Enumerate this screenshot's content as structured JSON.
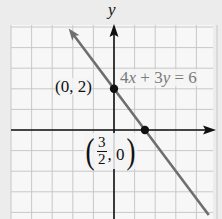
{
  "chart_data": {
    "type": "line",
    "title": "",
    "equation": "4x + 3y = 6",
    "xlabel": "",
    "ylabel": "y",
    "grid": true,
    "grid_unit": 1,
    "xlim": [
      -5,
      5
    ],
    "ylim": [
      -4,
      5
    ],
    "series": [
      {
        "name": "4x + 3y = 6",
        "slope": -1.3333,
        "intercept": 2,
        "x": [
          -2.2,
          4.6
        ],
        "y": [
          4.93,
          -4.13
        ],
        "color": "#6e6e6e"
      }
    ],
    "points": [
      {
        "x": 0,
        "y": 2,
        "label": "(0, 2)"
      },
      {
        "x": 1.5,
        "y": 0,
        "label": "(3/2, 0)"
      }
    ],
    "annotations": [
      {
        "text": "4x + 3y = 6",
        "near": [
          0,
          2
        ]
      },
      {
        "text": "(0, 2)",
        "near": [
          0,
          2
        ]
      },
      {
        "text": "(3/2, 0)",
        "near": [
          1.5,
          0
        ]
      }
    ]
  },
  "labels": {
    "y_axis": "y",
    "equation": {
      "c1": "4",
      "v1": "x",
      "op": " + ",
      "c2": "3",
      "v2": "y",
      "rhs": " = 6"
    },
    "point1": "(0, 2)",
    "point2": {
      "open": "(",
      "num": "3",
      "den": "2",
      "rest": ", 0",
      "close": ")"
    }
  },
  "colors": {
    "background": "#ececec",
    "plot_area": "#f7f7f7",
    "grid": "#c8c8c8",
    "axes": "#111111",
    "line": "#6e6e6e",
    "points": "#111111"
  }
}
